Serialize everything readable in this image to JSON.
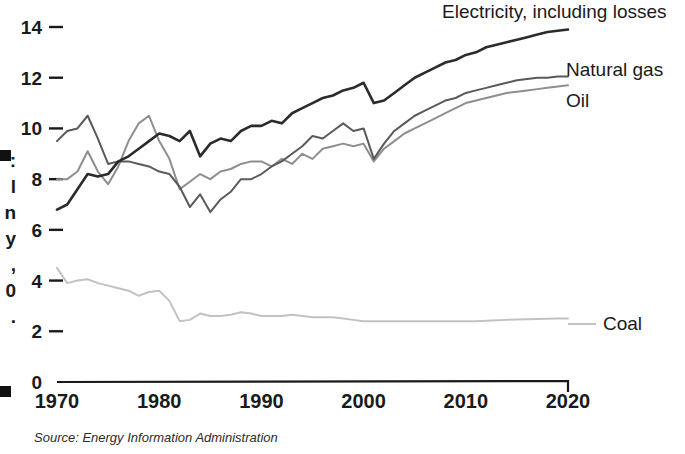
{
  "chart_data": {
    "type": "line",
    "title": "",
    "subtitle": "",
    "xlabel": "",
    "ylabel": "",
    "xlim": [
      1970,
      2020
    ],
    "ylim": [
      0,
      15
    ],
    "grid": false,
    "legend_position": "right-inline-labels",
    "source_note": "Source: Energy Information Administration",
    "x_ticks": [
      "1970",
      "1980",
      "1990",
      "2000",
      "2010",
      "2020"
    ],
    "x_tick_values": [
      1970,
      1980,
      1990,
      2000,
      2010,
      2020
    ],
    "y_ticks": [
      "0",
      "2",
      "4",
      "6",
      "8",
      "10",
      "12",
      "14"
    ],
    "y_tick_values": [
      0,
      2,
      4,
      6,
      8,
      10,
      12,
      14
    ],
    "x": [
      1970,
      1971,
      1972,
      1973,
      1974,
      1975,
      1976,
      1977,
      1978,
      1979,
      1980,
      1981,
      1982,
      1983,
      1984,
      1985,
      1986,
      1987,
      1988,
      1989,
      1990,
      1991,
      1992,
      1993,
      1994,
      1995,
      1996,
      1997,
      1998,
      1999,
      2000,
      2001,
      2002,
      2003,
      2004,
      2005,
      2006,
      2007,
      2008,
      2009,
      2010,
      2011,
      2012,
      2013,
      2014,
      2015,
      2016,
      2017,
      2018,
      2019,
      2020
    ],
    "series": [
      {
        "name": "Electricity, including losses",
        "color": "#2b2b2b",
        "label_x": 2011,
        "label_y": 14.8,
        "values": [
          6.8,
          7.0,
          7.6,
          8.2,
          8.1,
          8.2,
          8.7,
          8.9,
          9.2,
          9.5,
          9.8,
          9.7,
          9.5,
          9.9,
          8.9,
          9.4,
          9.6,
          9.5,
          9.9,
          10.1,
          10.1,
          10.3,
          10.2,
          10.6,
          10.8,
          11.0,
          11.2,
          11.3,
          11.5,
          11.6,
          11.8,
          11.0,
          11.1,
          11.4,
          11.7,
          12.0,
          12.2,
          12.4,
          12.6,
          12.7,
          12.9,
          13.0,
          13.2,
          13.3,
          13.4,
          13.5,
          13.6,
          13.7,
          13.8,
          13.85,
          13.9
        ]
      },
      {
        "name": "Natural gas",
        "color": "#5a5a5a",
        "label_x": 2011,
        "label_y": 12.3,
        "values": [
          9.5,
          9.9,
          10.0,
          10.5,
          9.6,
          8.6,
          8.7,
          8.7,
          8.6,
          8.5,
          8.3,
          8.2,
          7.7,
          6.9,
          7.4,
          6.7,
          7.2,
          7.5,
          8.0,
          8.0,
          8.2,
          8.5,
          8.7,
          9.0,
          9.3,
          9.7,
          9.6,
          9.9,
          10.2,
          9.9,
          10.0,
          8.8,
          9.4,
          9.9,
          10.2,
          10.5,
          10.7,
          10.9,
          11.1,
          11.2,
          11.4,
          11.5,
          11.6,
          11.7,
          11.8,
          11.9,
          11.95,
          12.0,
          12.0,
          12.05,
          12.05
        ]
      },
      {
        "name": "Oil",
        "color": "#8e8e8e",
        "label_x": 2011,
        "label_y": 11.5,
        "values": [
          8.0,
          8.0,
          8.3,
          9.1,
          8.3,
          7.8,
          8.5,
          9.5,
          10.2,
          10.5,
          9.5,
          8.8,
          7.6,
          7.9,
          8.2,
          8.0,
          8.3,
          8.4,
          8.6,
          8.7,
          8.7,
          8.5,
          8.8,
          8.6,
          9.0,
          8.8,
          9.2,
          9.3,
          9.4,
          9.3,
          9.4,
          8.7,
          9.2,
          9.5,
          9.8,
          10.0,
          10.2,
          10.4,
          10.6,
          10.8,
          11.0,
          11.1,
          11.2,
          11.3,
          11.4,
          11.45,
          11.5,
          11.55,
          11.6,
          11.65,
          11.7
        ]
      },
      {
        "name": "Coal",
        "color": "#c2c2c2",
        "label_x": 2011,
        "label_y": 2.6,
        "values": [
          4.5,
          3.9,
          4.0,
          4.05,
          3.9,
          3.8,
          3.7,
          3.6,
          3.4,
          3.55,
          3.6,
          3.2,
          2.4,
          2.45,
          2.7,
          2.6,
          2.6,
          2.65,
          2.75,
          2.7,
          2.6,
          2.6,
          2.6,
          2.65,
          2.6,
          2.55,
          2.55,
          2.55,
          2.5,
          2.45,
          2.4,
          2.4,
          2.4,
          2.4,
          2.4,
          2.4,
          2.4,
          2.4,
          2.4,
          2.4,
          2.4,
          2.4,
          2.42,
          2.44,
          2.45,
          2.46,
          2.47,
          2.48,
          2.49,
          2.5,
          2.5
        ]
      }
    ]
  },
  "side_caption_fragments": [
    ":",
    "l",
    "n",
    "y",
    ",",
    "0",
    "."
  ],
  "source": {
    "text": "Source: Energy Information Administration"
  }
}
